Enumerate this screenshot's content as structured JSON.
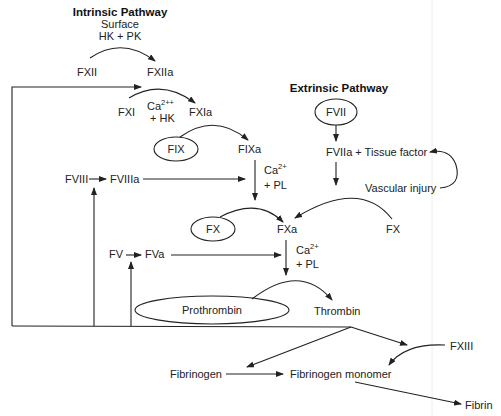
{
  "diagram": {
    "title_intrinsic": "Intrinsic Pathway",
    "title_extrinsic": "Extrinsic Pathway",
    "intrinsic_cofactors": {
      "line1": "Surface",
      "line2": "HK + PK"
    },
    "nodes": {
      "fxii": "FXII",
      "fxiia": "FXIIa",
      "fxi": "FXI",
      "fxia": "FXIa",
      "fxi_cofactor_ca": "Ca",
      "fxi_cofactor_ca_sup": "2++",
      "fxi_cofactor_hk": "+ HK",
      "fix": "FIX",
      "fixa": "FIXa",
      "fviii": "FVIII",
      "fviiia": "FVIIIa",
      "fixa_cofactor_ca": "Ca",
      "fixa_cofactor_ca_sup": "2+",
      "fixa_cofactor_pl": "+ PL",
      "fvii": "FVII",
      "fviia_tf": "FVIIa + Tissue factor",
      "vascular_injury": "Vascular injury",
      "fx_left": "FX",
      "fxa": "FXa",
      "fx_right": "FX",
      "fv": "FV",
      "fva": "FVa",
      "fxa_cofactor_ca": "Ca",
      "fxa_cofactor_ca_sup": "2+",
      "fxa_cofactor_pl": "+ PL",
      "prothrombin": "Prothrombin",
      "thrombin": "Thrombin",
      "fxiii": "FXIII",
      "fibrinogen": "Fibrinogen",
      "fibrinogen_monomer": "Fibrinogen monomer",
      "fibrin": "Fibrin"
    },
    "colors": {
      "line": "#222222",
      "text": "#222222",
      "background": "#ffffff"
    }
  }
}
